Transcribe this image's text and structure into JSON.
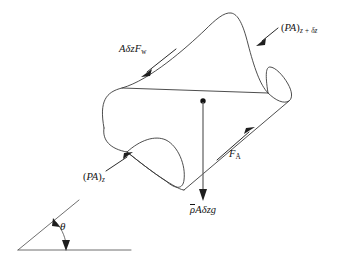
{
  "figure": {
    "name": "inclined-control-volume-force-balance",
    "background_color": "#ffffff",
    "line_color": "#3a3a3a",
    "force_line_color": "#6a6a6a",
    "text_color": "#141414"
  },
  "labels": {
    "wall_friction": {
      "name": "wall-friction-force-label",
      "text": "AδzF",
      "subscript": "w",
      "full": "AδzF_w"
    },
    "pressure_upper": {
      "name": "pressure-force-upper-label",
      "open": "(",
      "symbol": "PA",
      "close": ")",
      "subscript": "z + δz",
      "full": "(PA)_{z+δz}"
    },
    "pressure_lower": {
      "name": "pressure-force-lower-label",
      "open": "(",
      "symbol": "PA",
      "close": ")",
      "subscript": "z",
      "full": "(PA)_z"
    },
    "acceleration": {
      "name": "acceleration-force-label",
      "text": "F",
      "subscript": "A",
      "full": "F_A"
    },
    "weight": {
      "name": "weight-force-label",
      "rho_bar": "ρ",
      "rest": "Aδzg",
      "full": "ρ̄Aδzg"
    },
    "angle": {
      "name": "inclination-angle-label",
      "text": "θ",
      "full": "θ"
    }
  },
  "geometry": {
    "tube_outline_top": "M 104,128 C 99,101 106,92 122,88 C 150,80 186,48 205,30 C 215,20 224,12 231,13 C 238,14 243,24 248,44 C 254,67 260,85 268,93",
    "tube_outline_bottom": "M 127,152 C 137,160 152,172 166,181 C 176,187 181,190 184,190",
    "cap_upper_outer": "M 268,93 C 276,101 284,104 289,101 C 293,98 292,91 288,84 C 283,75 275,67 270,67 C 266,67 265,74 268,93",
    "cap_lower_outer": "M 127,152 C 140,140 155,135 166,140 C 178,146 186,165 184,180 C 183,189 176,190 166,181",
    "left_curve": "M 104,128 C 102,140 110,149 127,152",
    "edge_upper": "M 122,88 L 268,93",
    "edge_lower_right": "M 184,190 L 289,101",
    "wall_arrow_line": {
      "x1": 175,
      "y1": 50,
      "x2": 144,
      "y2": 74
    },
    "fa_arrow_line": {
      "x1": 218,
      "y1": 159,
      "x2": 252,
      "y2": 129
    },
    "weight_line": {
      "x1": 203,
      "y1": 101,
      "x2": 203,
      "y2": 199
    },
    "weight_dot": {
      "cx": 203,
      "cy": 101,
      "r": 2.6
    },
    "leader_pa_zdz": {
      "x1": 277,
      "y1": 29,
      "x2": 258,
      "y2": 44
    },
    "leader_pa_z": {
      "x1": 107,
      "y1": 170,
      "x2": 131,
      "y2": 154
    },
    "angle_hypotenuse": {
      "x1": 18,
      "y1": 250,
      "x2": 78,
      "y2": 201
    },
    "angle_baseline": {
      "x1": 18,
      "y1": 250,
      "x2": 131,
      "y2": 250
    },
    "angle_arc": "M 54,222 C 61,231 64,240 64,247"
  }
}
